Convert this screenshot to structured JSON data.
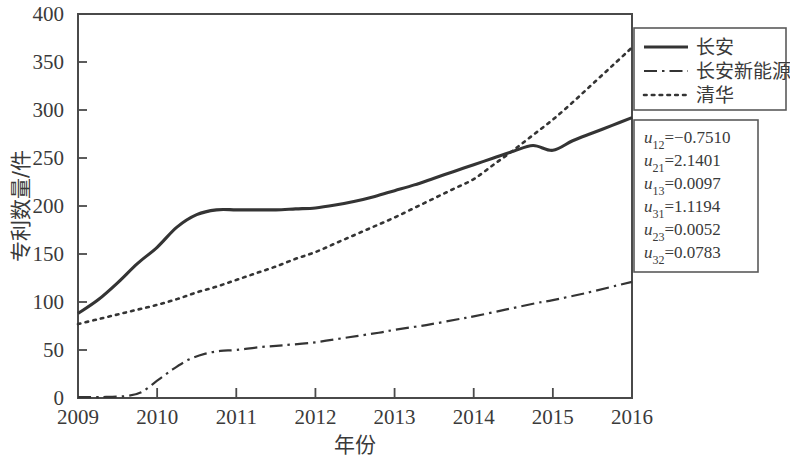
{
  "chart_data": {
    "type": "line",
    "title": "",
    "xlabel": "年份",
    "ylabel": "专利数量/件",
    "xlim": [
      2009,
      2016
    ],
    "ylim": [
      0,
      400
    ],
    "ytick_step": 50,
    "grid": false,
    "legend_position": "outside top-right",
    "x": [
      2009,
      2010,
      2011,
      2012,
      2013,
      2014,
      2015,
      2016
    ],
    "xticklabels": [
      "2009",
      "2010",
      "2011",
      "2012",
      "2013",
      "2014",
      "2015",
      "2016"
    ],
    "yticklabels": [
      "0",
      "50",
      "100",
      "150",
      "200",
      "250",
      "300",
      "350",
      "400"
    ],
    "series": [
      {
        "name": "长安",
        "style": "solid",
        "values": [
          88,
          150,
          196,
          197,
          205,
          228,
          258,
          292
        ],
        "points": [
          [
            2009.0,
            88
          ],
          [
            2009.25,
            102
          ],
          [
            2009.5,
            120
          ],
          [
            2009.75,
            140
          ],
          [
            2010.0,
            157
          ],
          [
            2010.25,
            178
          ],
          [
            2010.5,
            191
          ],
          [
            2010.75,
            196
          ],
          [
            2011.0,
            196
          ],
          [
            2011.25,
            196
          ],
          [
            2011.5,
            196
          ],
          [
            2011.75,
            197
          ],
          [
            2012.0,
            198
          ],
          [
            2012.25,
            201
          ],
          [
            2012.5,
            205
          ],
          [
            2012.75,
            210
          ],
          [
            2013.0,
            216
          ],
          [
            2013.25,
            222
          ],
          [
            2013.5,
            229
          ],
          [
            2013.75,
            236
          ],
          [
            2014.0,
            243
          ],
          [
            2014.25,
            250
          ],
          [
            2014.5,
            257
          ],
          [
            2014.75,
            263
          ],
          [
            2015.0,
            258
          ],
          [
            2015.25,
            268
          ],
          [
            2015.5,
            276
          ],
          [
            2015.75,
            284
          ],
          [
            2016.0,
            292
          ]
        ]
      },
      {
        "name": "长安新能源",
        "style": "dashdot",
        "values": [
          1,
          20,
          50,
          58,
          70,
          85,
          102,
          121
        ],
        "points": [
          [
            2009.0,
            1
          ],
          [
            2009.3,
            1
          ],
          [
            2009.6,
            2
          ],
          [
            2009.8,
            6
          ],
          [
            2010.0,
            18
          ],
          [
            2010.2,
            30
          ],
          [
            2010.4,
            40
          ],
          [
            2010.6,
            46
          ],
          [
            2010.8,
            49
          ],
          [
            2011.0,
            50
          ],
          [
            2011.3,
            53
          ],
          [
            2011.6,
            55
          ],
          [
            2012.0,
            58
          ],
          [
            2012.4,
            63
          ],
          [
            2012.8,
            68
          ],
          [
            2013.0,
            71
          ],
          [
            2013.4,
            76
          ],
          [
            2013.8,
            82
          ],
          [
            2014.0,
            85
          ],
          [
            2014.4,
            92
          ],
          [
            2014.8,
            99
          ],
          [
            2015.0,
            102
          ],
          [
            2015.4,
            109
          ],
          [
            2015.8,
            117
          ],
          [
            2016.0,
            121
          ]
        ]
      },
      {
        "name": "清华",
        "style": "dotted",
        "values": [
          77,
          97,
          123,
          152,
          188,
          228,
          290,
          365
        ],
        "points": [
          [
            2009.0,
            77
          ],
          [
            2009.25,
            82
          ],
          [
            2009.5,
            87
          ],
          [
            2009.75,
            92
          ],
          [
            2010.0,
            97
          ],
          [
            2010.25,
            103
          ],
          [
            2010.5,
            110
          ],
          [
            2010.75,
            116
          ],
          [
            2011.0,
            123
          ],
          [
            2011.25,
            130
          ],
          [
            2011.5,
            137
          ],
          [
            2011.75,
            145
          ],
          [
            2012.0,
            152
          ],
          [
            2012.25,
            161
          ],
          [
            2012.5,
            170
          ],
          [
            2012.75,
            179
          ],
          [
            2013.0,
            188
          ],
          [
            2013.25,
            198
          ],
          [
            2013.5,
            208
          ],
          [
            2013.75,
            218
          ],
          [
            2014.0,
            228
          ],
          [
            2014.25,
            243
          ],
          [
            2014.5,
            258
          ],
          [
            2014.75,
            274
          ],
          [
            2015.0,
            290
          ],
          [
            2015.25,
            308
          ],
          [
            2015.5,
            327
          ],
          [
            2015.75,
            346
          ],
          [
            2016.0,
            365
          ]
        ]
      }
    ],
    "annotations": [
      {
        "subject": "u",
        "sub": "12",
        "value": "=−0.7510"
      },
      {
        "subject": "u",
        "sub": "21",
        "value": "=2.1401"
      },
      {
        "subject": "u",
        "sub": "13",
        "value": "=0.0097"
      },
      {
        "subject": "u",
        "sub": "31",
        "value": "=1.1194"
      },
      {
        "subject": "u",
        "sub": "23",
        "value": "=0.0052"
      },
      {
        "subject": "u",
        "sub": "32",
        "value": "=0.0783"
      }
    ]
  }
}
